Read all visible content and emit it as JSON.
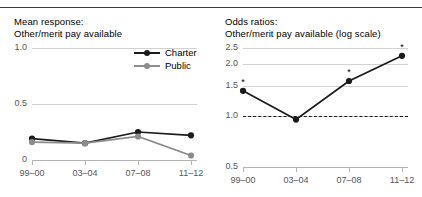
{
  "page": {
    "cropped_header_fragment": "",
    "background": "#ffffff"
  },
  "colors": {
    "charter": "#1a1a1a",
    "public": "#8c8c8c",
    "grid": "#d2d2d2",
    "axis": "#b4b4b4",
    "text": "#555555",
    "title": "#000000"
  },
  "legend": {
    "position": "top-right-of-left-panel",
    "items": [
      {
        "label": "Charter",
        "color": "#1a1a1a",
        "name": "legend-charter"
      },
      {
        "label": "Public",
        "color": "#8c8c8c",
        "name": "legend-public"
      }
    ]
  },
  "chart_data": [
    {
      "type": "line",
      "name": "mean-response",
      "title": "Mean response:\nOther/merit pay available",
      "xlabel": "",
      "ylabel": "",
      "categories": [
        "99–00",
        "03–04",
        "07–08",
        "11–12"
      ],
      "yticks": [
        0,
        0.5,
        1.0
      ],
      "yticklabels": [
        "0",
        "0.5",
        "1.0"
      ],
      "ylim": [
        0,
        1.0
      ],
      "scale": "linear",
      "grid": true,
      "series": [
        {
          "name": "Charter",
          "color": "#1a1a1a",
          "values": [
            0.19,
            0.15,
            0.25,
            0.22
          ]
        },
        {
          "name": "Public",
          "color": "#8c8c8c",
          "values": [
            0.16,
            0.15,
            0.21,
            0.04
          ]
        }
      ]
    },
    {
      "type": "line",
      "name": "odds-ratios",
      "title": "Odds ratios:\nOther/merit pay available (log scale)",
      "xlabel": "",
      "ylabel": "",
      "categories": [
        "99–00",
        "03–04",
        "07–08",
        "11–12"
      ],
      "yticks": [
        0.5,
        1.0,
        1.5,
        2.0,
        2.5
      ],
      "yticklabels": [
        "0.5",
        "1.0",
        "1.5",
        "2.0",
        "2.5"
      ],
      "ylim": [
        0.5,
        2.5
      ],
      "scale": "log",
      "grid": true,
      "reference_line": {
        "value": 1.0,
        "style": "dashed"
      },
      "series": [
        {
          "name": "Odds ratio",
          "color": "#1a1a1a",
          "values": [
            1.4,
            0.95,
            1.6,
            2.25
          ],
          "significance": [
            "*",
            "",
            "*",
            "*"
          ]
        }
      ]
    }
  ]
}
